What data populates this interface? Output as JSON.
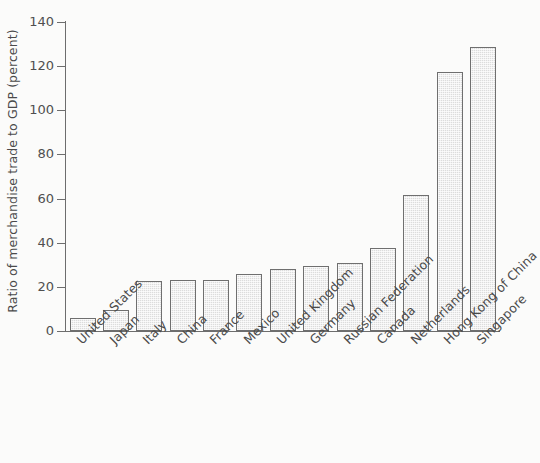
{
  "chart_data": {
    "type": "bar",
    "title": "",
    "xlabel": "",
    "ylabel": "Ratio of merchandise trade to GDP (percent)",
    "ylim": [
      0,
      140
    ],
    "ytick_labels": [
      "0",
      "20",
      "40",
      "60",
      "80",
      "100",
      "120",
      "140"
    ],
    "ytick_values": [
      0,
      20,
      40,
      60,
      80,
      100,
      120,
      140
    ],
    "grid": false,
    "legend": "none",
    "bar_fill_color": "#dcdcdc",
    "bar_edge_color": "#6f6f6f",
    "axis_color": "#6d6d6d",
    "background_color": "#fbfbfa",
    "categories": [
      "United States",
      "Japan",
      "Italy",
      "China",
      "France",
      "Mexico",
      "United Kingdom",
      "Germany",
      "Russian Federation",
      "Canada",
      "Netherlands",
      "Hong Kong of China",
      "Singapore"
    ],
    "values": [
      6,
      9.5,
      22.5,
      23,
      23.2,
      26,
      28,
      29.5,
      31,
      37.5,
      61.5,
      117.5,
      128.5
    ]
  }
}
